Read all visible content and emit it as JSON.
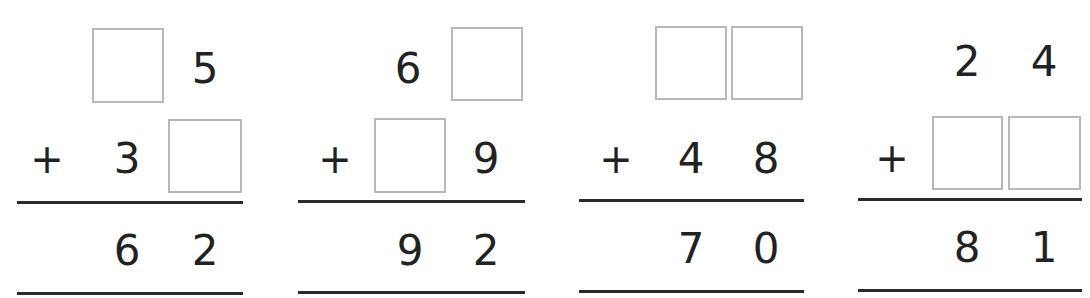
{
  "worksheet": {
    "operator": "+",
    "problems": [
      {
        "top": {
          "tens": "",
          "ones": "5"
        },
        "addend": {
          "tens": "3",
          "ones": ""
        },
        "sum": {
          "tens": "6",
          "ones": "2"
        },
        "blanks": [
          "top.tens",
          "addend.ones"
        ]
      },
      {
        "top": {
          "tens": "6",
          "ones": ""
        },
        "addend": {
          "tens": "",
          "ones": "9"
        },
        "sum": {
          "tens": "9",
          "ones": "2"
        },
        "blanks": [
          "top.ones",
          "addend.tens"
        ]
      },
      {
        "top": {
          "tens": "",
          "ones": ""
        },
        "addend": {
          "tens": "4",
          "ones": "8"
        },
        "sum": {
          "tens": "7",
          "ones": "0"
        },
        "blanks": [
          "top.tens",
          "top.ones"
        ]
      },
      {
        "top": {
          "tens": "2",
          "ones": "4"
        },
        "addend": {
          "tens": "",
          "ones": ""
        },
        "sum": {
          "tens": "8",
          "ones": "1"
        },
        "blanks": [
          "addend.tens",
          "addend.ones"
        ]
      }
    ]
  }
}
